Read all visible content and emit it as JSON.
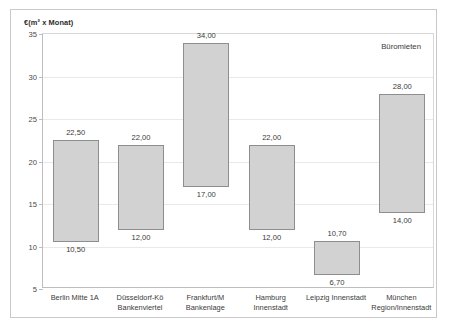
{
  "chart_data": {
    "type": "bar",
    "subtype": "floating-range-bar",
    "title": "",
    "annotation": "Büromieten",
    "ylabel": "€(m² x Monat)",
    "xlabel": "",
    "ylim": [
      5,
      35
    ],
    "yticks": [
      5,
      10,
      15,
      20,
      25,
      30,
      35
    ],
    "ytick_labels": [
      "5",
      "10",
      "15",
      "20",
      "25",
      "30",
      "35"
    ],
    "grid": true,
    "legend": false,
    "categories": [
      "Berlin Mitte 1A",
      "Düsseldorf-Kö\nBankenviertel",
      "Frankfurt/M\nBankenlage",
      "Hamburg\nInnenstadt",
      "Leipzig Innenstadt",
      "München\nRegion/Innenstadt"
    ],
    "category_lines": [
      [
        "Berlin Mitte 1A",
        ""
      ],
      [
        "Düsseldorf-Kö",
        "Bankenviertel"
      ],
      [
        "Frankfurt/M",
        "Bankenlage"
      ],
      [
        "Hamburg",
        "Innenstadt"
      ],
      [
        "Leipzig Innenstadt",
        ""
      ],
      [
        "München",
        "Region/Innenstadt"
      ]
    ],
    "series": [
      {
        "name": "Untergrenze",
        "values": [
          10.5,
          12.0,
          17.0,
          12.0,
          6.7,
          14.0
        ]
      },
      {
        "name": "Obergrenze",
        "values": [
          22.5,
          22.0,
          34.0,
          22.0,
          10.7,
          28.0
        ]
      }
    ],
    "bars": [
      {
        "category": "Berlin Mitte 1A",
        "low": 10.5,
        "high": 22.5,
        "low_label": "10,50",
        "high_label": "22,50"
      },
      {
        "category": "Düsseldorf-Kö Bankenviertel",
        "low": 12.0,
        "high": 22.0,
        "low_label": "12,00",
        "high_label": "22,00"
      },
      {
        "category": "Frankfurt/M Bankenlage",
        "low": 17.0,
        "high": 34.0,
        "low_label": "17,00",
        "high_label": "34,00"
      },
      {
        "category": "Hamburg Innenstadt",
        "low": 12.0,
        "high": 22.0,
        "low_label": "12,00",
        "high_label": "22,00"
      },
      {
        "category": "Leipzig Innenstadt",
        "low": 6.7,
        "high": 10.7,
        "low_label": "6,70",
        "high_label": "10,70"
      },
      {
        "category": "München Region/Innenstadt",
        "low": 14.0,
        "high": 28.0,
        "low_label": "14,00",
        "high_label": "28,00"
      }
    ],
    "colors": {
      "bar_fill": "#d2d2d2",
      "bar_border": "#8e8e8e",
      "grid": "#e9e9e9",
      "axis": "#bdbdbd",
      "text": "#3a3a3a",
      "frame": "#c9c9c9",
      "background": "#ffffff"
    }
  }
}
